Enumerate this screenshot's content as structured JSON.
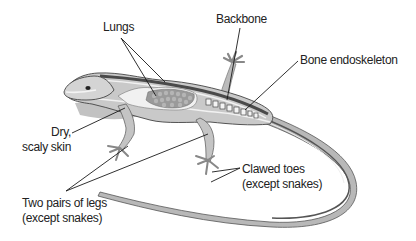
{
  "diagram": {
    "labels": {
      "lungs": "Lungs",
      "backbone": "Backbone",
      "bone_endoskeleton": "Bone endoskeleton",
      "dry_line1": "Dry,",
      "dry_line2": "scaly skin",
      "legs_line1": "Two pairs of legs",
      "legs_line2": "(except snakes)",
      "toes_line1": "Clawed toes",
      "toes_line2": "(except snakes)"
    },
    "colors": {
      "body": "#c9c9c9",
      "dark_stripe": "#4a4a4a",
      "light_stripe": "#f2f2f2",
      "lung": "#9a9a9a",
      "shadow": "#bdbdbd",
      "line": "#1a1a1a"
    }
  }
}
